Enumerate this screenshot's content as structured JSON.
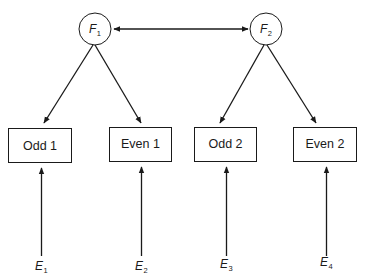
{
  "diagram": {
    "type": "confirmatory-factor-model",
    "factors": [
      {
        "id": "F1",
        "letter": "F",
        "sub": "1"
      },
      {
        "id": "F2",
        "letter": "F",
        "sub": "2"
      }
    ],
    "indicators": [
      {
        "id": "odd1",
        "label": "Odd 1",
        "factor": "F1",
        "error": "E1"
      },
      {
        "id": "even1",
        "label": "Even 1",
        "factor": "F1",
        "error": "E2"
      },
      {
        "id": "odd2",
        "label": "Odd 2",
        "factor": "F2",
        "error": "E3"
      },
      {
        "id": "even2",
        "label": "Even 2",
        "factor": "F2",
        "error": "E4"
      }
    ],
    "errors": [
      {
        "id": "E1",
        "letter": "E",
        "sub": "1"
      },
      {
        "id": "E2",
        "letter": "E",
        "sub": "2"
      },
      {
        "id": "E3",
        "letter": "E",
        "sub": "3"
      },
      {
        "id": "E4",
        "letter": "E",
        "sub": "4"
      }
    ],
    "edges": [
      {
        "from": "F1",
        "to": "F2",
        "kind": "covariance (double-headed)"
      },
      {
        "from": "F1",
        "to": "Odd 1",
        "kind": "loading"
      },
      {
        "from": "F1",
        "to": "Even 1",
        "kind": "loading"
      },
      {
        "from": "F2",
        "to": "Odd 2",
        "kind": "loading"
      },
      {
        "from": "F2",
        "to": "Even 2",
        "kind": "loading"
      },
      {
        "from": "E1",
        "to": "Odd 1",
        "kind": "error"
      },
      {
        "from": "E2",
        "to": "Even 1",
        "kind": "error"
      },
      {
        "from": "E3",
        "to": "Odd 2",
        "kind": "error"
      },
      {
        "from": "E4",
        "to": "Even 2",
        "kind": "error"
      }
    ],
    "colors": {
      "stroke": "#1a1a1a",
      "background": "#ffffff"
    }
  }
}
